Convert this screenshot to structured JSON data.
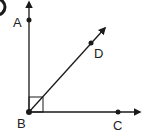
{
  "figure": {
    "badge": "",
    "points": {
      "A": {
        "label": "A",
        "x": 29,
        "y": 20
      },
      "B": {
        "label": "B",
        "x": 29,
        "y": 112
      },
      "C": {
        "label": "C",
        "x": 118,
        "y": 112
      },
      "D": {
        "label": "D",
        "x": 91,
        "y": 43
      }
    },
    "rays": [
      "BA",
      "BC",
      "BD"
    ],
    "right_angle": "ABC",
    "colors": {
      "line": "#1a1a1a",
      "background": "#ffffff"
    }
  }
}
